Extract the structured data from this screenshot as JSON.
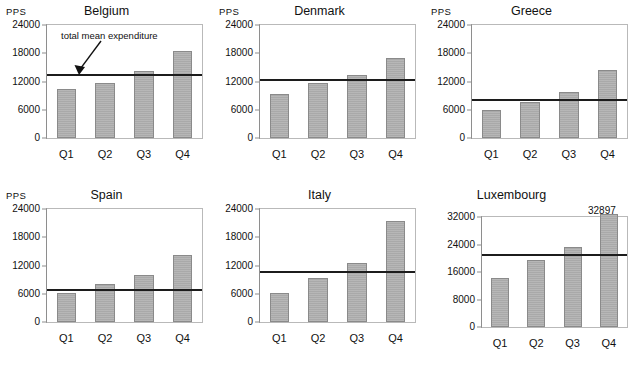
{
  "figure": {
    "unit_label": "PPS",
    "annotation": {
      "text": "total mean expenditure",
      "on_panel": "Belgium"
    }
  },
  "chart_data": [
    {
      "type": "bar",
      "title": "Belgium",
      "categories": [
        "Q1",
        "Q2",
        "Q3",
        "Q4"
      ],
      "values": [
        10400,
        11600,
        14300,
        18500
      ],
      "mean_line": 13400,
      "mean_line_label": "total mean expenditure",
      "xlabel": "",
      "ylabel": "PPS",
      "ylim": [
        0,
        24000
      ],
      "yticks": [
        0,
        6000,
        12000,
        18000,
        24000
      ],
      "ytick_labels": [
        "0",
        "6000",
        "12000",
        "18000",
        "24000"
      ],
      "grid": false,
      "legend": false
    },
    {
      "type": "bar",
      "title": "Denmark",
      "categories": [
        "Q1",
        "Q2",
        "Q3",
        "Q4"
      ],
      "values": [
        9400,
        11700,
        13400,
        17000
      ],
      "mean_line": 12400,
      "xlabel": "",
      "ylabel": "PPS",
      "ylim": [
        0,
        24000
      ],
      "yticks": [
        0,
        6000,
        12000,
        18000,
        24000
      ],
      "ytick_labels": [
        "0",
        "6000",
        "12000",
        "18000",
        "24000"
      ],
      "grid": false,
      "legend": false
    },
    {
      "type": "bar",
      "title": "Greece",
      "categories": [
        "Q1",
        "Q2",
        "Q3",
        "Q4"
      ],
      "values": [
        6000,
        7600,
        9800,
        14500
      ],
      "mean_line": 8000,
      "xlabel": "",
      "ylabel": "PPS",
      "ylim": [
        0,
        24000
      ],
      "yticks": [
        0,
        6000,
        12000,
        18000,
        24000
      ],
      "ytick_labels": [
        "0",
        "6000",
        "12000",
        "18000",
        "24000"
      ],
      "grid": false,
      "legend": false
    },
    {
      "type": "bar",
      "title": "Spain",
      "categories": [
        "Q1",
        "Q2",
        "Q3",
        "Q4"
      ],
      "values": [
        6100,
        8100,
        9900,
        14200
      ],
      "mean_line": 6800,
      "xlabel": "",
      "ylabel": "PPS",
      "ylim": [
        0,
        24000
      ],
      "yticks": [
        0,
        6000,
        12000,
        18000,
        24000
      ],
      "ytick_labels": [
        "0",
        "6000",
        "12000",
        "18000",
        "24000"
      ],
      "grid": false,
      "legend": false
    },
    {
      "type": "bar",
      "title": "Italy",
      "categories": [
        "Q1",
        "Q2",
        "Q3",
        "Q4"
      ],
      "values": [
        6100,
        9300,
        12600,
        21500
      ],
      "mean_line": 10700,
      "xlabel": "",
      "ylabel": "",
      "ylim": [
        0,
        24000
      ],
      "yticks": [
        0,
        6000,
        12000,
        18000,
        24000
      ],
      "ytick_labels": [
        "0",
        "6000",
        "12000",
        "18000",
        "24000"
      ],
      "grid": false,
      "legend": false
    },
    {
      "type": "bar",
      "title": "Luxembourg",
      "categories": [
        "Q1",
        "Q2",
        "Q3",
        "Q4"
      ],
      "values": [
        14200,
        19400,
        23200,
        32897
      ],
      "value_labels": {
        "Q4": "32897"
      },
      "mean_line": 21000,
      "xlabel": "",
      "ylabel": "",
      "ylim": [
        0,
        32000
      ],
      "yticks": [
        0,
        8000,
        16000,
        24000,
        32000
      ],
      "ytick_labels": [
        "0",
        "8000",
        "16000",
        "24000",
        "32000"
      ],
      "grid": false,
      "legend": false
    }
  ],
  "colors": {
    "bar_fill": "#a9a9a9",
    "bar_stroke": "#8a8a8a",
    "mean_line": "#1c1c1c",
    "axis": "#8e8e8e",
    "frame": "#b9b9b9",
    "text": "#111111",
    "background": "#ffffff"
  }
}
